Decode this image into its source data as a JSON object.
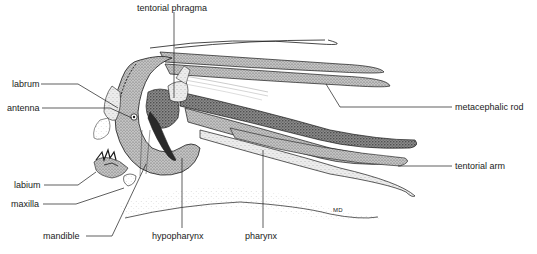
{
  "figure": {
    "signature": "MD",
    "labels": [
      {
        "id": "tentorial-phragma",
        "text": "tentorial phragma",
        "x": 138,
        "y": 3
      },
      {
        "id": "labrum",
        "text": "labrum",
        "x": 12,
        "y": 79
      },
      {
        "id": "antenna",
        "text": "antenna",
        "x": 7,
        "y": 103
      },
      {
        "id": "metacephalic-rod",
        "text": "metacephalic rod",
        "x": 455,
        "y": 102
      },
      {
        "id": "tentorial-arm",
        "text": "tentorial arm",
        "x": 455,
        "y": 161
      },
      {
        "id": "labium",
        "text": "labium",
        "x": 14,
        "y": 180
      },
      {
        "id": "maxilla",
        "text": "maxilla",
        "x": 11,
        "y": 199
      },
      {
        "id": "mandible",
        "text": "mandible",
        "x": 43,
        "y": 231
      },
      {
        "id": "hypopharynx",
        "text": "hypopharynx",
        "x": 152,
        "y": 231
      },
      {
        "id": "pharynx",
        "text": "pharynx",
        "x": 245,
        "y": 231
      }
    ]
  },
  "colors": {
    "ink": "#1a1a1a",
    "stipple_dark": "#5a5a5a",
    "stipple_mid": "#9a9a9a",
    "stipple_light": "#cfcfcf",
    "background": "#ffffff"
  }
}
